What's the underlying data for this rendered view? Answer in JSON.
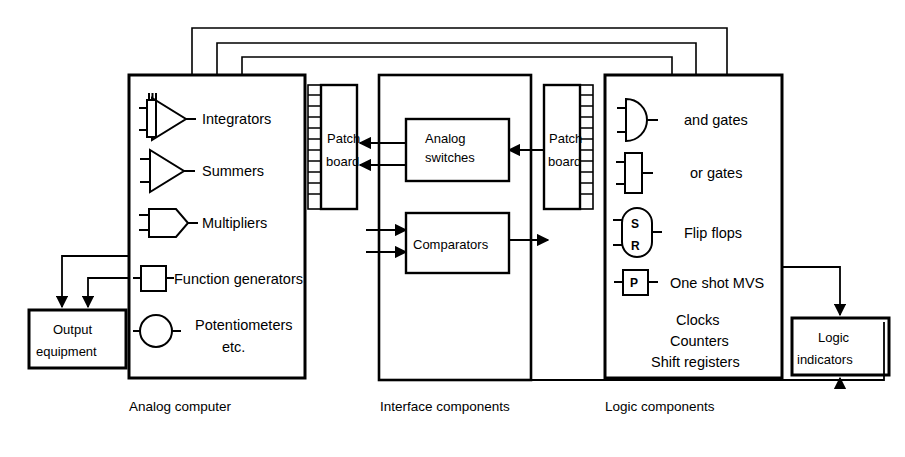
{
  "diagram": {
    "ink_color": "#000000",
    "background": "#ffffff"
  },
  "blocks": {
    "analog_computer": {
      "label": "Analog computer",
      "items": [
        {
          "icon": "integrator-symbol",
          "label": "Integrators"
        },
        {
          "icon": "summer-amplifier-symbol",
          "label": "Summers"
        },
        {
          "icon": "multiplier-symbol",
          "label": "Multipliers"
        },
        {
          "icon": "function-generator-symbol",
          "label": "Function generators"
        },
        {
          "icon": "potentiometer-symbol",
          "label": "Potentiometers"
        },
        {
          "icon": "none",
          "label": "etc."
        }
      ]
    },
    "interface_components": {
      "label": "Interface components",
      "items": [
        {
          "label": "Analog switches"
        },
        {
          "label": "Comparators"
        }
      ]
    },
    "logic_components": {
      "label": "Logic components",
      "items": [
        {
          "icon": "and-gate-symbol",
          "label": "and gates"
        },
        {
          "icon": "or-gate-symbol",
          "label": "or gates"
        },
        {
          "icon": "flip-flop-symbol",
          "label": "Flip flops",
          "pins": [
            "S",
            "R"
          ]
        },
        {
          "icon": "one-shot-symbol",
          "label": "One shot MVS",
          "pins": [
            "P"
          ]
        },
        {
          "icon": "none",
          "label": "Clocks"
        },
        {
          "icon": "none",
          "label": "Counters"
        },
        {
          "icon": "none",
          "label": "Shift registers"
        }
      ]
    },
    "patch_board_left": {
      "line1": "Patch",
      "line2": "board"
    },
    "patch_board_right": {
      "line1": "Patch",
      "line2": "board"
    },
    "output_equipment": {
      "line1": "Output",
      "line2": "equipment"
    },
    "logic_indicators": {
      "line1": "Logic",
      "line2": "indicators"
    }
  },
  "captions": [
    "Analog computer",
    "Interface components",
    "Logic components"
  ]
}
